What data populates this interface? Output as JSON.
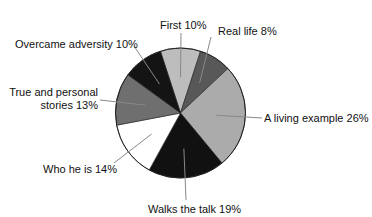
{
  "chart_data": {
    "type": "pie",
    "title": "",
    "start": "first slice centered at 12 o'clock, clockwise",
    "slices": [
      {
        "label": "First",
        "value": 10,
        "text": "First 10%",
        "color": "#bdbdbd"
      },
      {
        "label": "Real life",
        "value": 8,
        "text": "Real life 8%",
        "color": "#585858"
      },
      {
        "label": "A living example",
        "value": 26,
        "text": "A living example 26%",
        "color": "#ababab"
      },
      {
        "label": "Walks the talk",
        "value": 19,
        "text": "Walks the talk 19%",
        "color": "#111111"
      },
      {
        "label": "Who he is",
        "value": 14,
        "text": "Who he is 14%",
        "color": "#ffffff"
      },
      {
        "label": "True and personal stories",
        "value": 13,
        "text_lines": [
          "True and personal",
          "stories 13%"
        ],
        "color": "#6f6f6f"
      },
      {
        "label": "Overcame adversity",
        "value": 10,
        "text": "Overcame adversity 10%",
        "color": "#141414"
      }
    ],
    "legend": "none (direct labels with leader lines)"
  }
}
